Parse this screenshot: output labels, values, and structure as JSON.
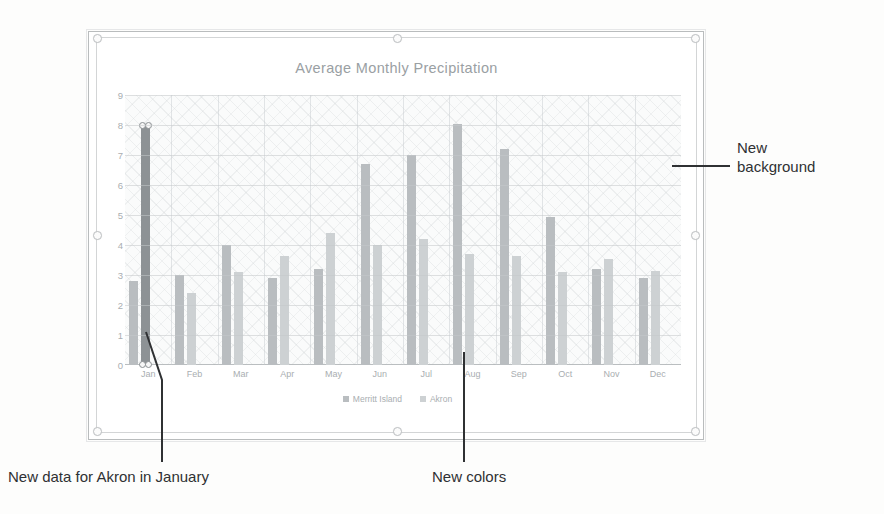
{
  "chart_data": {
    "type": "bar",
    "title": "Average Monthly Precipitation",
    "xlabel": "",
    "ylabel": "",
    "ylim": [
      0,
      9
    ],
    "yticks": [
      0,
      1,
      2,
      3,
      4,
      5,
      6,
      7,
      8,
      9
    ],
    "grid": true,
    "legend_position": "bottom",
    "categories": [
      "Jan",
      "Feb",
      "Mar",
      "Apr",
      "May",
      "Jun",
      "Jul",
      "Aug",
      "Sep",
      "Oct",
      "Nov",
      "Dec"
    ],
    "series": [
      {
        "name": "Merritt Island",
        "color": "#b9bdc0",
        "values": [
          2.8,
          3.0,
          4.0,
          2.9,
          3.2,
          6.7,
          7.0,
          8.05,
          7.2,
          4.95,
          3.2,
          2.9
        ]
      },
      {
        "name": "Akron",
        "color": "#cdd1d3",
        "values": [
          8.0,
          2.4,
          3.1,
          3.65,
          4.4,
          4.0,
          4.2,
          3.7,
          3.65,
          3.1,
          3.55,
          3.15
        ]
      }
    ],
    "selected_point": {
      "series": "Akron",
      "category": "Jan",
      "value": 8.0,
      "color": "#8d9295"
    }
  },
  "chart": {
    "title": "Average Monthly Precipitation",
    "legend": [
      {
        "label": "Merritt Island",
        "color": "#b9bdc0"
      },
      {
        "label": "Akron",
        "color": "#cdd1d3"
      }
    ]
  },
  "annotations": {
    "background": {
      "line1": "New",
      "line2": "background"
    },
    "akron_january": "New data for Akron in January",
    "new_colors": "New colors"
  }
}
